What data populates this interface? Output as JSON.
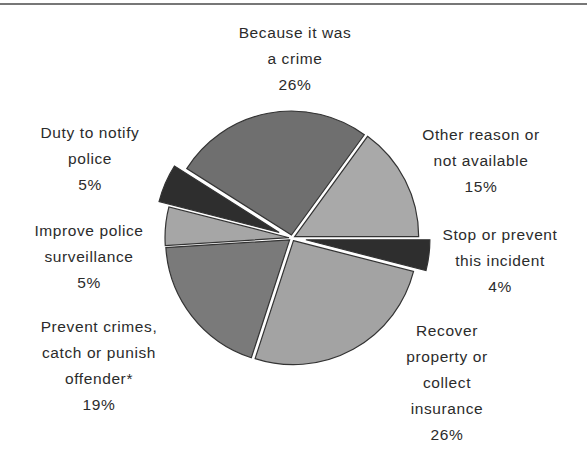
{
  "chart_data": {
    "type": "pie",
    "title": "",
    "start_angle_deg": 302.4,
    "direction": "clockwise",
    "slices": [
      {
        "name": "Because it was a crime",
        "label_lines": [
          "Because it was",
          "a crime"
        ],
        "value": 26,
        "value_label": "26%",
        "color": "#6f6f6f",
        "exploded": false
      },
      {
        "name": "Other reason or not available",
        "label_lines": [
          "Other reason or",
          "not available"
        ],
        "value": 15,
        "value_label": "15%",
        "color": "#a9a9a9",
        "exploded": false
      },
      {
        "name": "Stop or prevent this incident",
        "label_lines": [
          "Stop or prevent",
          "this incident"
        ],
        "value": 4,
        "value_label": "4%",
        "color": "#2e2e2e",
        "exploded": true
      },
      {
        "name": "Recover property or collect insurance",
        "label_lines": [
          "Recover",
          "property or",
          "collect",
          "insurance"
        ],
        "value": 26,
        "value_label": "26%",
        "color": "#a3a3a3",
        "exploded": false
      },
      {
        "name": "Prevent crimes, catch or punish offender*",
        "label_lines": [
          "Prevent crimes,",
          "catch or punish",
          "offender*"
        ],
        "value": 19,
        "value_label": "19%",
        "color": "#7a7a7a",
        "exploded": false
      },
      {
        "name": "Improve police surveillance",
        "label_lines": [
          "Improve police",
          "surveillance"
        ],
        "value": 5,
        "value_label": "5%",
        "color": "#a6a6a6",
        "exploded": false
      },
      {
        "name": "Duty to notify police",
        "label_lines": [
          "Duty to notify",
          "police"
        ],
        "value": 5,
        "value_label": "5%",
        "color": "#2e2e2e",
        "exploded": true
      }
    ],
    "legend": "none (direct labels)",
    "value_format": "percent"
  },
  "labels": {
    "crime": {
      "line1": "Because it was",
      "line2": "a crime",
      "pct": "26%"
    },
    "other": {
      "line1": "Other reason or",
      "line2": "not available",
      "pct": "15%"
    },
    "stop": {
      "line1": "Stop or prevent",
      "line2": "this incident",
      "pct": "4%"
    },
    "recover": {
      "line1": "Recover",
      "line2": "property or",
      "line3": "collect",
      "line4": "insurance",
      "pct": "26%"
    },
    "prevent": {
      "line1": "Prevent crimes,",
      "line2": "catch or punish",
      "line3": "offender*",
      "pct": "19%"
    },
    "improve": {
      "line1": "Improve police",
      "line2": "surveillance",
      "pct": "5%"
    },
    "duty": {
      "line1": "Duty to notify",
      "line2": "police",
      "pct": "5%"
    }
  }
}
